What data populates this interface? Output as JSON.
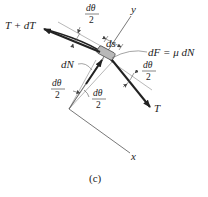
{
  "figure": {
    "caption": "(c)",
    "labels": {
      "tension_plus": "T + dT",
      "tension": "T",
      "normal": "dN",
      "friction": "dF = μ dN",
      "arc_length": "ds",
      "axis_x": "x",
      "axis_y": "y",
      "half_angle_num": "dθ",
      "half_angle_den": "2"
    },
    "colors": {
      "line": "#333333",
      "thin_line": "#777777",
      "element_fill": "#b8b8b8",
      "text": "#222222"
    }
  }
}
